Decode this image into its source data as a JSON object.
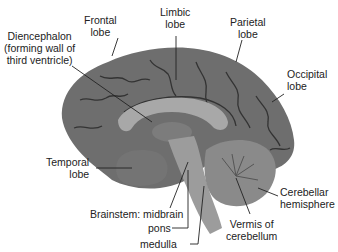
{
  "diagram": {
    "labels": {
      "frontal_lobe": {
        "line1": "Frontal",
        "line2": "lobe"
      },
      "limbic_lobe": {
        "line1": "Limbic",
        "line2": "lobe"
      },
      "parietal_lobe": {
        "line1": "Parietal",
        "line2": "lobe"
      },
      "occipital_lobe": {
        "line1": "Occipital",
        "line2": "lobe"
      },
      "diencephalon": {
        "line1": "Diencephalon",
        "line2": "(forming wall of",
        "line3": "third ventricle)"
      },
      "temporal_lobe": {
        "line1": "Temporal",
        "line2": "lobe"
      },
      "cerebellar_hemisphere": {
        "line1": "Cerebellar",
        "line2": "hemisphere"
      },
      "brainstem_midbrain": "Brainstem: midbrain",
      "pons": "pons",
      "medulla": "medulla",
      "vermis": {
        "line1": "Vermis of",
        "line2": "cerebellum"
      }
    },
    "colors": {
      "cortex": "#6e6e6e",
      "cortex_dark": "#3a3a3a",
      "corpus_callosum": "#a8a8a8",
      "brainstem": "#9c9c9c",
      "cerebellum": "#8a8a8a",
      "leader_line": "#222222"
    }
  }
}
